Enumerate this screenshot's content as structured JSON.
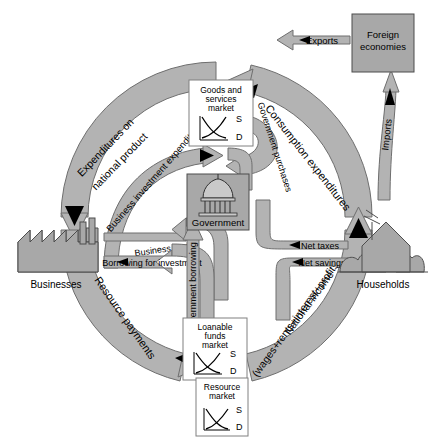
{
  "diagram": {
    "palette": {
      "flow_fill": "#b3b3b3",
      "flow_stroke": "#6e6e6e",
      "box_fill": "#ffffff",
      "box_stroke": "#808080",
      "actor_fill": "#a8a8a8",
      "actor_stroke": "#4d4d4d",
      "text": "#000000"
    },
    "actors": [
      {
        "id": "businesses",
        "label": "Businesses",
        "icon": "factory-icon"
      },
      {
        "id": "households",
        "label": "Households",
        "icon": "house-icon"
      },
      {
        "id": "government",
        "label": "Government",
        "icon": "capitol-dome-icon"
      },
      {
        "id": "foreign",
        "label": "Foreign\neconomies",
        "line1": "Foreign",
        "line2": "economies",
        "icon": "foreign-box-icon"
      }
    ],
    "markets": [
      {
        "id": "goods",
        "line1": "Goods and",
        "line2": "services",
        "line3": "market",
        "supply": "S",
        "demand": "D"
      },
      {
        "id": "loanable",
        "line1": "Loanable",
        "line2": "funds",
        "line3": "market",
        "supply": "S",
        "demand": "D"
      },
      {
        "id": "resource",
        "line1": "Resource",
        "line2": "market",
        "line3": "",
        "supply": "S",
        "demand": "D"
      }
    ],
    "flows": [
      {
        "id": "expenditures-on-national-product",
        "label": "Expenditures on national product",
        "line1": "Expenditures on",
        "line2": "national product"
      },
      {
        "id": "consumption-expenditures",
        "label": "Consumption expenditures"
      },
      {
        "id": "business-investment-expenditures",
        "label": "Business investment expenditures"
      },
      {
        "id": "government-purchases",
        "label": "Government purchases"
      },
      {
        "id": "exports",
        "label": "Exports"
      },
      {
        "id": "imports",
        "label": "Imports"
      },
      {
        "id": "net-taxes",
        "label": "Net taxes"
      },
      {
        "id": "net-savings",
        "label": "Net savings"
      },
      {
        "id": "business-taxes",
        "label": "Business taxes"
      },
      {
        "id": "borrowing-for-investment",
        "label": "Borrowing for investment"
      },
      {
        "id": "government-borrowing",
        "label": "Government borrowing"
      },
      {
        "id": "resource-payments",
        "label": "Resource payments"
      },
      {
        "id": "national-income",
        "label": "National income (wages+rents+interest+profits)",
        "line1": "National income",
        "line2": "(wages+rents+interest+profits)"
      }
    ]
  }
}
